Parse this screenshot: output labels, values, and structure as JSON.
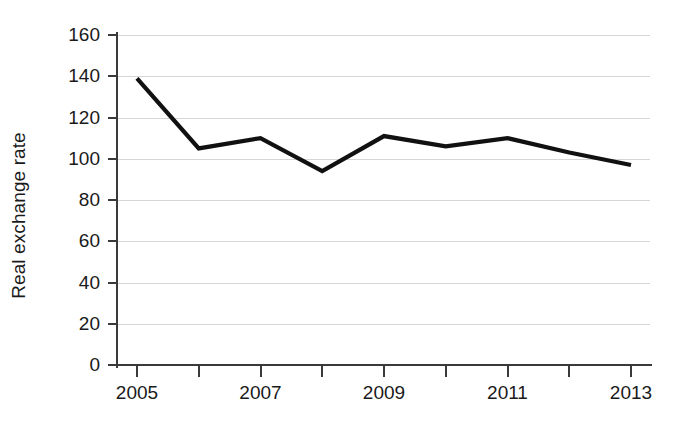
{
  "chart_data": {
    "type": "line",
    "title": "",
    "xlabel": "",
    "ylabel": "Real exchange rate",
    "x": [
      2005,
      2006,
      2007,
      2008,
      2009,
      2010,
      2011,
      2012,
      2013
    ],
    "categories": [
      "2005",
      "2006",
      "2007",
      "2008",
      "2009",
      "2010",
      "2011",
      "2012",
      "2013"
    ],
    "values": [
      139,
      105,
      110,
      94,
      111,
      106,
      110,
      103,
      97
    ],
    "series": [
      {
        "name": "Real exchange rate",
        "values": [
          139,
          105,
          110,
          94,
          111,
          106,
          110,
          103,
          97
        ]
      }
    ],
    "ylim": [
      0,
      160
    ],
    "xlim": [
      2005,
      2013
    ],
    "y_ticks": [
      0,
      20,
      40,
      60,
      80,
      100,
      120,
      140,
      160
    ],
    "y_tick_labels": [
      "0",
      "20",
      "40",
      "60",
      "80",
      "100",
      "120",
      "140",
      "160"
    ],
    "x_ticks": [
      2005,
      2006,
      2007,
      2008,
      2009,
      2010,
      2011,
      2012,
      2013
    ],
    "x_tick_labels": [
      "2005",
      "",
      "2007",
      "",
      "2009",
      "",
      "2011",
      "",
      "2013"
    ],
    "grid": "horizontal",
    "legend": "none",
    "line_color": "#111111",
    "grid_color": "#d6d6d6",
    "axis_color": "#3a3a3a",
    "background_color": "#ffffff"
  }
}
